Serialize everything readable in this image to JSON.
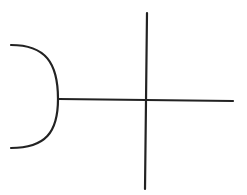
{
  "diagram": {
    "type": "line-symbol",
    "background": "#ffffff",
    "stroke_color": "#222222",
    "stroke_width": 2.2,
    "elements": {
      "socket_arc": {
        "label": "socket-arc",
        "start": [
          11,
          45
        ],
        "apex": [
          58,
          99
        ],
        "end": [
          11,
          148
        ]
      },
      "connector_line": {
        "label": "horizontal-connector-line",
        "x1": 59,
        "y1": 99,
        "x2": 233,
        "y2": 101
      },
      "cross_line": {
        "label": "vertical-cross-line",
        "x1": 147,
        "y1": 13,
        "x2": 145,
        "y2": 189
      }
    }
  }
}
